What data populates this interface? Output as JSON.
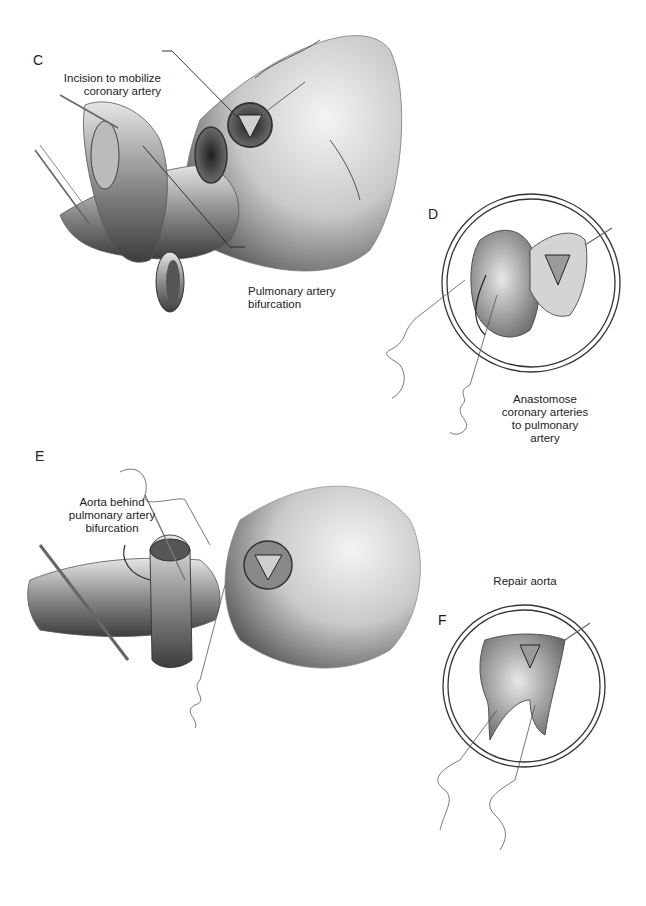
{
  "figure": {
    "panels": [
      {
        "letter": "C",
        "labels": [
          {
            "lines": [
              "Incision to mobilize",
              "coronary artery"
            ]
          },
          {
            "lines": [
              "Pulmonary artery",
              "bifurcation"
            ]
          }
        ]
      },
      {
        "letter": "D",
        "labels": [
          {
            "lines": [
              "Anastomose",
              "coronary arteries",
              "to pulmonary",
              "artery"
            ]
          }
        ]
      },
      {
        "letter": "E",
        "labels": [
          {
            "lines": [
              "Aorta behind",
              "pulmonary artery",
              "bifurcation"
            ]
          }
        ]
      },
      {
        "letter": "F",
        "labels": [
          {
            "lines": [
              "Repair aorta"
            ]
          }
        ]
      }
    ],
    "colors": {
      "background": "#ffffff",
      "ink": "#222222",
      "tissue_dark": "#3a3a3a",
      "tissue_mid": "#8a8a8a",
      "tissue_light": "#d8d8d8"
    }
  }
}
